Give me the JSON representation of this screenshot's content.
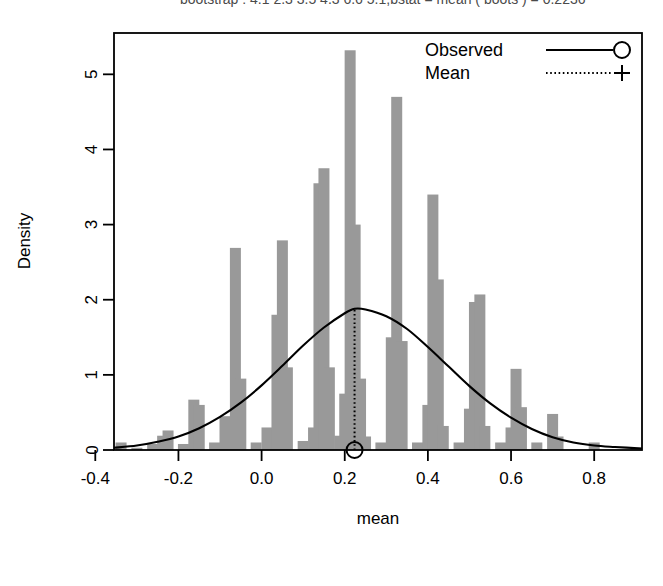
{
  "figure": {
    "cropped_title": "bootstrap : 4.1 2.3 3.5 4.3 6.6 5.1,bstat  =  mean ( boots )      =  0.2236"
  },
  "chart_data": {
    "type": "bar",
    "title": "",
    "xlabel": "mean",
    "ylabel": "Density",
    "xlim": [
      -0.355,
      0.915
    ],
    "ylim": [
      0,
      5.55
    ],
    "xticks": [
      -0.4,
      -0.2,
      0.0,
      0.2,
      0.4,
      0.6,
      0.8
    ],
    "xticklabels": [
      "-0.4",
      "-0.2",
      "0.0",
      "0.2",
      "0.4",
      "0.6",
      "0.8"
    ],
    "yticks": [
      0,
      1,
      2,
      3,
      4,
      5
    ],
    "yticklabels": [
      "0",
      "1",
      "2",
      "3",
      "4",
      "5"
    ],
    "grid": false,
    "bar_color": "#999999",
    "line_color": "#000000",
    "legend": {
      "position": "top-right",
      "entries": [
        {
          "label": "Observed",
          "linestyle": "solid",
          "marker": "circle"
        },
        {
          "label": "Mean",
          "linestyle": "dotted",
          "marker": "plus"
        }
      ]
    },
    "observed_marker": {
      "x": 0.2236,
      "y": 0.0
    },
    "mean_line": {
      "x": 0.2236,
      "y_top": 1.88
    },
    "histogram": {
      "note": "bin centers (mean value) and density heights",
      "bins": [
        {
          "x": -0.338,
          "density": 0.1
        },
        {
          "x": -0.3,
          "density": 0.03
        },
        {
          "x": -0.262,
          "density": 0.08
        },
        {
          "x": -0.238,
          "density": 0.19
        },
        {
          "x": -0.225,
          "density": 0.26
        },
        {
          "x": -0.188,
          "density": 0.08
        },
        {
          "x": -0.163,
          "density": 0.67
        },
        {
          "x": -0.15,
          "density": 0.6
        },
        {
          "x": -0.113,
          "density": 0.1
        },
        {
          "x": -0.088,
          "density": 0.45
        },
        {
          "x": -0.063,
          "density": 2.69
        },
        {
          "x": -0.05,
          "density": 0.95
        },
        {
          "x": -0.013,
          "density": 0.1
        },
        {
          "x": 0.013,
          "density": 0.3
        },
        {
          "x": 0.037,
          "density": 1.8
        },
        {
          "x": 0.05,
          "density": 2.79
        },
        {
          "x": 0.062,
          "density": 1.1
        },
        {
          "x": 0.1,
          "density": 0.12
        },
        {
          "x": 0.125,
          "density": 0.3
        },
        {
          "x": 0.138,
          "density": 3.55
        },
        {
          "x": 0.15,
          "density": 3.75
        },
        {
          "x": 0.163,
          "density": 1.1
        },
        {
          "x": 0.188,
          "density": 0.19
        },
        {
          "x": 0.2,
          "density": 0.75
        },
        {
          "x": 0.213,
          "density": 5.32
        },
        {
          "x": 0.225,
          "density": 3.0
        },
        {
          "x": 0.238,
          "density": 0.95
        },
        {
          "x": 0.25,
          "density": 0.18
        },
        {
          "x": 0.287,
          "density": 0.1
        },
        {
          "x": 0.312,
          "density": 1.5
        },
        {
          "x": 0.325,
          "density": 4.7
        },
        {
          "x": 0.338,
          "density": 1.45
        },
        {
          "x": 0.375,
          "density": 0.1
        },
        {
          "x": 0.4,
          "density": 0.6
        },
        {
          "x": 0.412,
          "density": 3.4
        },
        {
          "x": 0.425,
          "density": 2.27
        },
        {
          "x": 0.437,
          "density": 0.32
        },
        {
          "x": 0.475,
          "density": 0.1
        },
        {
          "x": 0.5,
          "density": 0.55
        },
        {
          "x": 0.512,
          "density": 1.97
        },
        {
          "x": 0.525,
          "density": 2.07
        },
        {
          "x": 0.537,
          "density": 0.32
        },
        {
          "x": 0.575,
          "density": 0.1
        },
        {
          "x": 0.6,
          "density": 0.3
        },
        {
          "x": 0.612,
          "density": 1.08
        },
        {
          "x": 0.625,
          "density": 0.57
        },
        {
          "x": 0.662,
          "density": 0.1
        },
        {
          "x": 0.7,
          "density": 0.48
        },
        {
          "x": 0.713,
          "density": 0.18
        },
        {
          "x": 0.8,
          "density": 0.1
        },
        {
          "x": 0.9,
          "density": 0.03
        }
      ]
    },
    "density_curve": {
      "note": "smooth normal-like density overlay, peak 1.88 at x=0.2236",
      "peak_x": 0.2236,
      "peak_y": 1.88,
      "sigma": 0.212,
      "points": [
        {
          "x": -0.355,
          "y": 0.03
        },
        {
          "x": -0.3,
          "y": 0.06
        },
        {
          "x": -0.25,
          "y": 0.11
        },
        {
          "x": -0.2,
          "y": 0.18
        },
        {
          "x": -0.15,
          "y": 0.29
        },
        {
          "x": -0.1,
          "y": 0.44
        },
        {
          "x": -0.05,
          "y": 0.63
        },
        {
          "x": 0.0,
          "y": 0.86
        },
        {
          "x": 0.05,
          "y": 1.12
        },
        {
          "x": 0.1,
          "y": 1.39
        },
        {
          "x": 0.15,
          "y": 1.63
        },
        {
          "x": 0.2,
          "y": 1.82
        },
        {
          "x": 0.2236,
          "y": 1.88
        },
        {
          "x": 0.25,
          "y": 1.87
        },
        {
          "x": 0.3,
          "y": 1.78
        },
        {
          "x": 0.35,
          "y": 1.61
        },
        {
          "x": 0.4,
          "y": 1.37
        },
        {
          "x": 0.45,
          "y": 1.11
        },
        {
          "x": 0.5,
          "y": 0.85
        },
        {
          "x": 0.55,
          "y": 0.62
        },
        {
          "x": 0.6,
          "y": 0.43
        },
        {
          "x": 0.65,
          "y": 0.28
        },
        {
          "x": 0.7,
          "y": 0.17
        },
        {
          "x": 0.75,
          "y": 0.1
        },
        {
          "x": 0.8,
          "y": 0.06
        },
        {
          "x": 0.85,
          "y": 0.04
        },
        {
          "x": 0.915,
          "y": 0.02
        }
      ]
    }
  }
}
